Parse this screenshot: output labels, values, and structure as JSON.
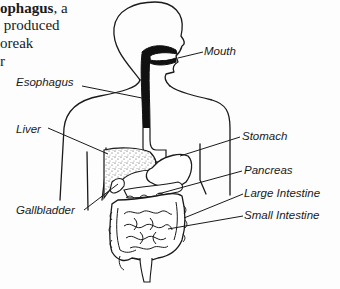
{
  "text_fragment": {
    "lines": [
      {
        "bold": "ophagus",
        "rest": ", a"
      },
      {
        "bold": "",
        "rest": " produced"
      },
      {
        "bold": "",
        "rest": "oreak"
      },
      {
        "bold": "",
        "rest": "r"
      }
    ]
  },
  "diagram": {
    "labels": {
      "mouth": "Mouth",
      "esophagus": "Esophagus",
      "liver": "Liver",
      "gallbladder": "Gallbladder",
      "stomach": "Stomach",
      "pancreas": "Pancreas",
      "large_intestine": "Large Intestine",
      "small_intestine": "Small Intestine"
    }
  },
  "colors": {
    "ink": "#1a1a1a",
    "background": "#fdfdfd"
  }
}
